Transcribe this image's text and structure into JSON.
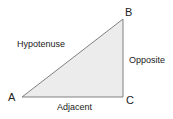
{
  "diagram": {
    "vertices": {
      "A": {
        "label": "A",
        "x": 22,
        "y": 97
      },
      "B": {
        "label": "B",
        "x": 123,
        "y": 19
      },
      "C": {
        "label": "C",
        "x": 123,
        "y": 97
      }
    },
    "sides": {
      "hypotenuse": {
        "label": "Hypotenuse",
        "from": "A",
        "to": "B"
      },
      "opposite": {
        "label": "Opposite",
        "from": "B",
        "to": "C"
      },
      "adjacent": {
        "label": "Adjacent",
        "from": "A",
        "to": "C"
      }
    },
    "colors": {
      "fill": "#ececec",
      "stroke": "#808080",
      "text": "#222222"
    }
  }
}
